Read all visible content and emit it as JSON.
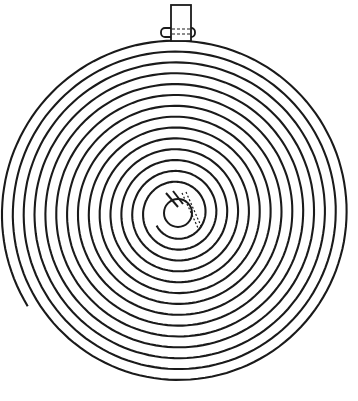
{
  "figure": {
    "type": "line-drawing",
    "stroke_color": "#1a1a1a",
    "background": "#ffffff",
    "spiral": {
      "center": [
        177,
        213
      ],
      "inner_radius": 24,
      "outer_radius": 176,
      "turns": 14,
      "end_angle_deg": 212
    },
    "collet": {
      "center": [
        178,
        213
      ],
      "hole_radius": 14,
      "outer_radius": 25
    },
    "stud": {
      "x": 168,
      "y": 4,
      "width": 20,
      "height": 36
    }
  }
}
